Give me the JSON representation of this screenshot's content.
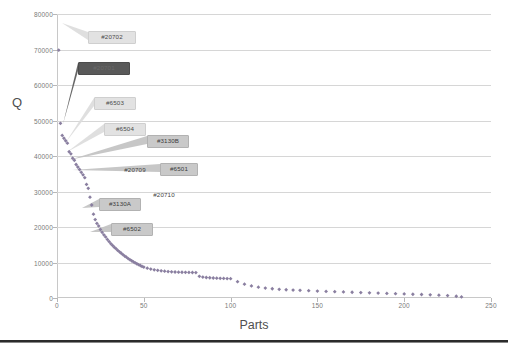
{
  "chart_data": {
    "type": "scatter",
    "title": "",
    "xlabel": "Parts",
    "ylabel": "Q",
    "xlim": [
      0,
      250
    ],
    "ylim": [
      0,
      80000
    ],
    "grid": true,
    "legend": false,
    "legend_position": "none",
    "x_ticks": [
      "0",
      "50",
      "100",
      "150",
      "200",
      "250"
    ],
    "x_tick_values": [
      0,
      50,
      100,
      150,
      200,
      250
    ],
    "y_ticks": [
      "0",
      "10000",
      "20000",
      "30000",
      "40000",
      "50000",
      "60000",
      "70000",
      "80000"
    ],
    "y_tick_values": [
      0,
      10000,
      20000,
      30000,
      40000,
      50000,
      60000,
      70000,
      80000
    ],
    "marker_color": "#8a7fa0",
    "marker_shape": "diamond",
    "series": [
      {
        "name": "Q vs Parts",
        "x": [
          1,
          2,
          3,
          4,
          5,
          6,
          7,
          8,
          9,
          10,
          11,
          12,
          13,
          14,
          15,
          16,
          17,
          18,
          19,
          20,
          21,
          22,
          23,
          24,
          25,
          26,
          27,
          28,
          29,
          30,
          31,
          32,
          33,
          34,
          35,
          36,
          37,
          38,
          39,
          40,
          41,
          42,
          43,
          44,
          45,
          46,
          47,
          48,
          49,
          50,
          52,
          54,
          56,
          58,
          60,
          62,
          64,
          66,
          68,
          70,
          72,
          74,
          76,
          78,
          80,
          82,
          84,
          86,
          88,
          90,
          92,
          94,
          96,
          98,
          100,
          104,
          108,
          112,
          116,
          120,
          124,
          128,
          132,
          136,
          140,
          145,
          150,
          155,
          160,
          165,
          170,
          175,
          180,
          185,
          190,
          195,
          200,
          205,
          210,
          215,
          220,
          225,
          230,
          233
        ],
        "y": [
          69800,
          49200,
          45800,
          45000,
          44300,
          43600,
          41200,
          40600,
          39400,
          38800,
          37600,
          36900,
          36200,
          35400,
          34700,
          33900,
          32000,
          30900,
          28400,
          26200,
          23600,
          22100,
          21000,
          20300,
          19300,
          18500,
          17800,
          17200,
          16500,
          15900,
          15300,
          14800,
          14300,
          13900,
          13400,
          13000,
          12600,
          12200,
          11800,
          11500,
          11100,
          10800,
          10500,
          10200,
          9900,
          9650,
          9400,
          9150,
          8900,
          8700,
          8400,
          8150,
          7950,
          7800,
          7650,
          7550,
          7450,
          7380,
          7320,
          7280,
          7250,
          7230,
          7210,
          7190,
          7170,
          6100,
          5900,
          5780,
          5700,
          5640,
          5590,
          5550,
          5510,
          5480,
          5450,
          4600,
          3900,
          3400,
          3050,
          2800,
          2600,
          2450,
          2330,
          2230,
          2150,
          2050,
          1950,
          1860,
          1780,
          1700,
          1620,
          1540,
          1460,
          1380,
          1300,
          1220,
          1140,
          1060,
          980,
          890,
          790,
          670,
          500,
          300
        ]
      }
    ],
    "annotations": [
      {
        "label": "#20702",
        "style": "light",
        "x_px": 88,
        "y_px": 31,
        "width": 48,
        "anchor_x": 62,
        "anchor_y": 23
      },
      {
        "label": "#20701",
        "style": "dark",
        "x_px": 78,
        "y_px": 62,
        "width": 52,
        "anchor_x": 63,
        "anchor_y": 124
      },
      {
        "label": "#6503",
        "style": "light",
        "x_px": 94,
        "y_px": 97,
        "width": 42,
        "anchor_x": 66,
        "anchor_y": 142
      },
      {
        "label": "#6504",
        "style": "light",
        "x_px": 104,
        "y_px": 123,
        "width": 42,
        "anchor_x": 67,
        "anchor_y": 152
      },
      {
        "label": "#3130B",
        "style": "normal",
        "x_px": 147,
        "y_px": 135,
        "width": 42,
        "anchor_x": 69,
        "anchor_y": 160
      },
      {
        "label": "#20709",
        "style": "plain",
        "x_px": 114,
        "y_px": 164,
        "width": 42,
        "anchor_x": 70,
        "anchor_y": 166
      },
      {
        "label": "#6501",
        "style": "normal",
        "x_px": 160,
        "y_px": 163,
        "width": 38,
        "anchor_x": 72,
        "anchor_y": 170
      },
      {
        "label": "#20710",
        "style": "plain",
        "x_px": 142,
        "y_px": 189,
        "width": 44,
        "anchor_x": 79,
        "anchor_y": 193
      },
      {
        "label": "#3130A",
        "style": "normal",
        "x_px": 99,
        "y_px": 198,
        "width": 42,
        "anchor_x": 82,
        "anchor_y": 208
      },
      {
        "label": "#6502",
        "style": "normal",
        "x_px": 111,
        "y_px": 223,
        "width": 42,
        "anchor_x": 90,
        "anchor_y": 232
      }
    ]
  },
  "colors": {
    "marker": "#8a7fa0",
    "callout_dark": "#595959",
    "callout_mid": "#c9c9c9",
    "callout_light": "#e2e2e2",
    "grid": "#d6d6d6",
    "tick_text": "#7a7a7a",
    "axis_title": "#4f4f4f",
    "bottom_rule": "#2b2b2b"
  }
}
